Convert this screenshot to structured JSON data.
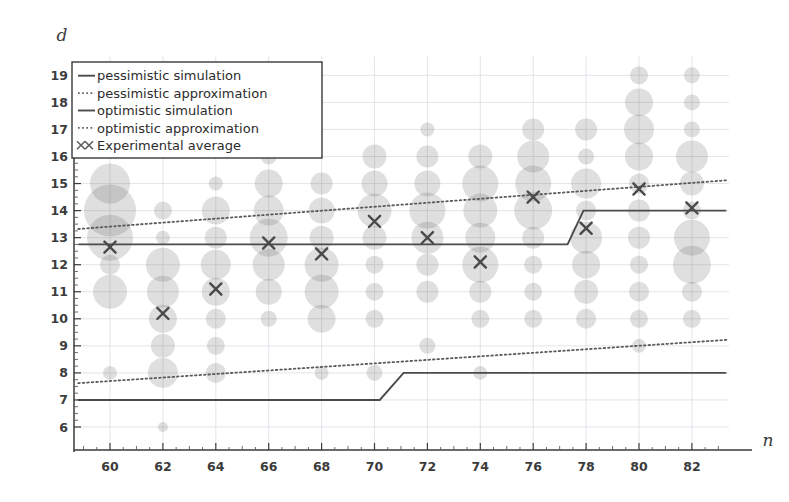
{
  "chart_data": {
    "type": "scatter",
    "title": "",
    "xlabel": "n",
    "ylabel": "d",
    "xlim": [
      58.6,
      83.4
    ],
    "ylim": [
      5.3,
      19.7
    ],
    "xticks": [
      60,
      62,
      64,
      66,
      68,
      70,
      72,
      74,
      76,
      78,
      80,
      82
    ],
    "xtick_labels": [
      "60",
      "62",
      "64",
      "66",
      "68",
      "70",
      "72",
      "74",
      "76",
      "78",
      "80",
      "82"
    ],
    "x_minor_ticks": [
      59,
      61,
      63,
      65,
      67,
      69,
      71,
      73,
      75,
      77,
      79,
      81,
      83
    ],
    "yticks": [
      6,
      7,
      8,
      9,
      10,
      11,
      12,
      13,
      14,
      15,
      16,
      17,
      18,
      19
    ],
    "ytick_labels": [
      "6",
      "7",
      "8",
      "9",
      "10",
      "11",
      "12",
      "13",
      "14",
      "15",
      "16",
      "17",
      "18",
      "19"
    ],
    "grid": true,
    "legend_position": "upper-left",
    "legend": [
      {
        "label": "pessimistic simulation",
        "marker": "solid-line"
      },
      {
        "label": "pessimistic approximation",
        "marker": "dotted-line"
      },
      {
        "label": "optimistic simulation",
        "marker": "solid-line"
      },
      {
        "label": "optimistic approximation",
        "marker": "dotted-line"
      },
      {
        "label": "Experimental average",
        "marker": "x-marker"
      }
    ],
    "bubbles_note": "Bubble area encodes frequency of observed depth d at size n",
    "bubbles": [
      {
        "n": 60,
        "d": 15,
        "size": 20
      },
      {
        "n": 60,
        "d": 14,
        "size": 26
      },
      {
        "n": 60,
        "d": 13,
        "size": 23
      },
      {
        "n": 60,
        "d": 12,
        "size": 10
      },
      {
        "n": 60,
        "d": 11,
        "size": 17
      },
      {
        "n": 60,
        "d": 8,
        "size": 7
      },
      {
        "n": 62,
        "d": 14,
        "size": 9
      },
      {
        "n": 62,
        "d": 13,
        "size": 7
      },
      {
        "n": 62,
        "d": 12,
        "size": 17
      },
      {
        "n": 62,
        "d": 11,
        "size": 16
      },
      {
        "n": 62,
        "d": 10,
        "size": 14
      },
      {
        "n": 62,
        "d": 9,
        "size": 12
      },
      {
        "n": 62,
        "d": 8,
        "size": 15
      },
      {
        "n": 62,
        "d": 6,
        "size": 5
      },
      {
        "n": 64,
        "d": 15,
        "size": 7
      },
      {
        "n": 64,
        "d": 14,
        "size": 14
      },
      {
        "n": 64,
        "d": 13,
        "size": 11
      },
      {
        "n": 64,
        "d": 12,
        "size": 15
      },
      {
        "n": 64,
        "d": 11,
        "size": 14
      },
      {
        "n": 64,
        "d": 10,
        "size": 10
      },
      {
        "n": 64,
        "d": 9,
        "size": 9
      },
      {
        "n": 64,
        "d": 8,
        "size": 10
      },
      {
        "n": 66,
        "d": 16,
        "size": 8
      },
      {
        "n": 66,
        "d": 15,
        "size": 14
      },
      {
        "n": 66,
        "d": 14,
        "size": 15
      },
      {
        "n": 66,
        "d": 13,
        "size": 19
      },
      {
        "n": 66,
        "d": 12,
        "size": 16
      },
      {
        "n": 66,
        "d": 11,
        "size": 13
      },
      {
        "n": 66,
        "d": 10,
        "size": 8
      },
      {
        "n": 68,
        "d": 15,
        "size": 11
      },
      {
        "n": 68,
        "d": 14,
        "size": 13
      },
      {
        "n": 68,
        "d": 13,
        "size": 12
      },
      {
        "n": 68,
        "d": 12,
        "size": 17
      },
      {
        "n": 68,
        "d": 11,
        "size": 17
      },
      {
        "n": 68,
        "d": 10,
        "size": 14
      },
      {
        "n": 68,
        "d": 8,
        "size": 7
      },
      {
        "n": 70,
        "d": 16,
        "size": 12
      },
      {
        "n": 70,
        "d": 15,
        "size": 13
      },
      {
        "n": 70,
        "d": 14,
        "size": 17
      },
      {
        "n": 70,
        "d": 13,
        "size": 12
      },
      {
        "n": 70,
        "d": 12,
        "size": 9
      },
      {
        "n": 70,
        "d": 11,
        "size": 9
      },
      {
        "n": 70,
        "d": 10,
        "size": 9
      },
      {
        "n": 70,
        "d": 8,
        "size": 8
      },
      {
        "n": 72,
        "d": 17,
        "size": 7
      },
      {
        "n": 72,
        "d": 16,
        "size": 11
      },
      {
        "n": 72,
        "d": 15,
        "size": 13
      },
      {
        "n": 72,
        "d": 14,
        "size": 18
      },
      {
        "n": 72,
        "d": 13,
        "size": 16
      },
      {
        "n": 72,
        "d": 12,
        "size": 11
      },
      {
        "n": 72,
        "d": 11,
        "size": 11
      },
      {
        "n": 72,
        "d": 9,
        "size": 8
      },
      {
        "n": 74,
        "d": 16,
        "size": 12
      },
      {
        "n": 74,
        "d": 15,
        "size": 18
      },
      {
        "n": 74,
        "d": 14,
        "size": 17
      },
      {
        "n": 74,
        "d": 13,
        "size": 15
      },
      {
        "n": 74,
        "d": 12,
        "size": 18
      },
      {
        "n": 74,
        "d": 11,
        "size": 11
      },
      {
        "n": 74,
        "d": 10,
        "size": 9
      },
      {
        "n": 74,
        "d": 8,
        "size": 7
      },
      {
        "n": 76,
        "d": 17,
        "size": 11
      },
      {
        "n": 76,
        "d": 16,
        "size": 16
      },
      {
        "n": 76,
        "d": 15,
        "size": 18
      },
      {
        "n": 76,
        "d": 14,
        "size": 19
      },
      {
        "n": 76,
        "d": 13,
        "size": 11
      },
      {
        "n": 76,
        "d": 12,
        "size": 9
      },
      {
        "n": 76,
        "d": 11,
        "size": 9
      },
      {
        "n": 76,
        "d": 10,
        "size": 9
      },
      {
        "n": 78,
        "d": 17,
        "size": 11
      },
      {
        "n": 78,
        "d": 16,
        "size": 8
      },
      {
        "n": 78,
        "d": 15,
        "size": 15
      },
      {
        "n": 78,
        "d": 14,
        "size": 10
      },
      {
        "n": 78,
        "d": 13,
        "size": 16
      },
      {
        "n": 78,
        "d": 12,
        "size": 14
      },
      {
        "n": 78,
        "d": 11,
        "size": 12
      },
      {
        "n": 78,
        "d": 10,
        "size": 10
      },
      {
        "n": 80,
        "d": 19,
        "size": 9
      },
      {
        "n": 80,
        "d": 18,
        "size": 14
      },
      {
        "n": 80,
        "d": 17,
        "size": 15
      },
      {
        "n": 80,
        "d": 16,
        "size": 14
      },
      {
        "n": 80,
        "d": 15,
        "size": 10
      },
      {
        "n": 80,
        "d": 14,
        "size": 11
      },
      {
        "n": 80,
        "d": 13,
        "size": 11
      },
      {
        "n": 80,
        "d": 12,
        "size": 9
      },
      {
        "n": 80,
        "d": 11,
        "size": 10
      },
      {
        "n": 80,
        "d": 10,
        "size": 9
      },
      {
        "n": 80,
        "d": 9,
        "size": 7
      },
      {
        "n": 82,
        "d": 19,
        "size": 8
      },
      {
        "n": 82,
        "d": 18,
        "size": 8
      },
      {
        "n": 82,
        "d": 17,
        "size": 8
      },
      {
        "n": 82,
        "d": 16,
        "size": 16
      },
      {
        "n": 82,
        "d": 15,
        "size": 12
      },
      {
        "n": 82,
        "d": 14,
        "size": 9
      },
      {
        "n": 82,
        "d": 13,
        "size": 18
      },
      {
        "n": 82,
        "d": 12,
        "size": 19
      },
      {
        "n": 82,
        "d": 11,
        "size": 10
      },
      {
        "n": 82,
        "d": 10,
        "size": 9
      }
    ],
    "series": [
      {
        "name": "pessimistic simulation",
        "style": "solid",
        "points": [
          {
            "n": 58.8,
            "d": 12.75
          },
          {
            "n": 77.3,
            "d": 12.75
          },
          {
            "n": 77.9,
            "d": 14.0
          },
          {
            "n": 83.3,
            "d": 14.0
          }
        ]
      },
      {
        "name": "pessimistic approximation",
        "style": "dotted",
        "points": [
          {
            "n": 58.8,
            "d": 13.32
          },
          {
            "n": 83.3,
            "d": 15.12
          }
        ]
      },
      {
        "name": "optimistic simulation",
        "style": "solid",
        "points": [
          {
            "n": 58.8,
            "d": 7.0
          },
          {
            "n": 70.2,
            "d": 7.0
          },
          {
            "n": 71.1,
            "d": 8.0
          },
          {
            "n": 83.3,
            "d": 8.0
          }
        ]
      },
      {
        "name": "optimistic approximation",
        "style": "dotted",
        "points": [
          {
            "n": 58.8,
            "d": 7.62
          },
          {
            "n": 83.3,
            "d": 9.22
          }
        ]
      },
      {
        "name": "Experimental average",
        "style": "x-marker",
        "points": [
          {
            "n": 60,
            "d": 12.65
          },
          {
            "n": 62,
            "d": 10.2
          },
          {
            "n": 64,
            "d": 11.1
          },
          {
            "n": 66,
            "d": 12.8
          },
          {
            "n": 68,
            "d": 12.4
          },
          {
            "n": 70,
            "d": 13.6
          },
          {
            "n": 72,
            "d": 13.0
          },
          {
            "n": 74,
            "d": 12.1
          },
          {
            "n": 76,
            "d": 14.5
          },
          {
            "n": 78,
            "d": 13.35
          },
          {
            "n": 80,
            "d": 14.8
          },
          {
            "n": 82,
            "d": 14.1
          }
        ]
      }
    ]
  }
}
